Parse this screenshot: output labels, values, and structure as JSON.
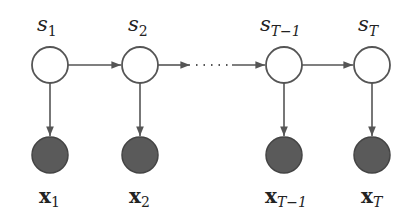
{
  "diagram": {
    "type": "hidden-markov-model",
    "colors": {
      "stroke": "#555555",
      "hidden_fill": "#ffffff",
      "observed_fill": "#5a5a5a",
      "text": "#222222"
    },
    "hidden_nodes": [
      {
        "id": "s1",
        "base": "s",
        "sub": "1",
        "cx": 50,
        "cy": 65
      },
      {
        "id": "s2",
        "base": "s",
        "sub": "2",
        "cx": 140,
        "cy": 65
      },
      {
        "id": "sT-1",
        "base": "s",
        "sub": "T−1",
        "cx": 284,
        "cy": 65
      },
      {
        "id": "sT",
        "base": "s",
        "sub": "T",
        "cx": 372,
        "cy": 65
      }
    ],
    "observed_nodes": [
      {
        "id": "x1",
        "base": "x",
        "sub": "1",
        "cx": 50,
        "cy": 155
      },
      {
        "id": "x2",
        "base": "x",
        "sub": "2",
        "cx": 140,
        "cy": 155
      },
      {
        "id": "xT-1",
        "base": "x",
        "sub": "T−1",
        "cx": 284,
        "cy": 155
      },
      {
        "id": "xT",
        "base": "x",
        "sub": "T",
        "cx": 372,
        "cy": 155
      }
    ],
    "edges": [
      {
        "from": "s1",
        "to": "s2",
        "style": "solid"
      },
      {
        "from": "s2",
        "to": "sT-1",
        "style": "dotted-middle"
      },
      {
        "from": "sT-1",
        "to": "sT",
        "style": "solid"
      },
      {
        "from": "s1",
        "to": "x1",
        "style": "solid"
      },
      {
        "from": "s2",
        "to": "x2",
        "style": "solid"
      },
      {
        "from": "sT-1",
        "to": "xT-1",
        "style": "solid"
      },
      {
        "from": "sT",
        "to": "xT",
        "style": "solid"
      }
    ],
    "labels": {
      "s1": {
        "base": "s",
        "sub": "1"
      },
      "s2": {
        "base": "s",
        "sub": "2"
      },
      "sT1": {
        "base": "s",
        "sub": "T−1"
      },
      "sT": {
        "base": "s",
        "sub": "T"
      },
      "x1": {
        "base": "x",
        "sub": "1"
      },
      "x2": {
        "base": "x",
        "sub": "2"
      },
      "xT1": {
        "base": "x",
        "sub": "T−1"
      },
      "xT": {
        "base": "x",
        "sub": "T"
      }
    }
  }
}
